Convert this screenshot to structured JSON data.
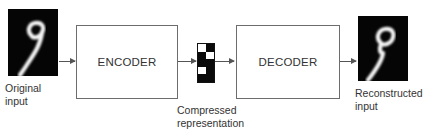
{
  "diagram": {
    "type": "autoencoder",
    "input": {
      "label_line1": "Original",
      "label_line2": "input",
      "content": "handwritten digit 9"
    },
    "encoder": {
      "label": "ENCODER"
    },
    "code": {
      "label_line1": "Compressed",
      "label_line2": "representation",
      "grid": [
        [
          "w",
          "b"
        ],
        [
          "b",
          "w"
        ],
        [
          "b",
          "b"
        ],
        [
          "w",
          "b"
        ],
        [
          "b",
          "b"
        ]
      ]
    },
    "decoder": {
      "label": "DECODER"
    },
    "output": {
      "label_line1": "Reconstructed",
      "label_line2": "input",
      "content": "handwritten digit 9"
    },
    "colors": {
      "box_border": "#6d6d6d",
      "arrow": "#555555",
      "image_bg": "#050505",
      "stroke": "#ffffff"
    }
  }
}
